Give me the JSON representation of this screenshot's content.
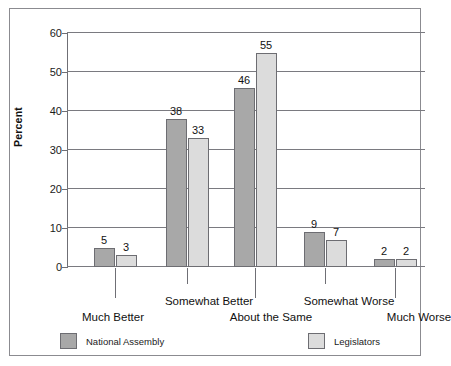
{
  "chart_data": {
    "type": "bar",
    "title": "",
    "xlabel": "",
    "ylabel": "Percent",
    "ylim": [
      0,
      60
    ],
    "yticks": [
      0,
      10,
      20,
      30,
      40,
      50,
      60
    ],
    "ytick_labels": [
      "0",
      "10",
      "20",
      "30",
      "40",
      "50",
      "60"
    ],
    "grid": true,
    "legend_position": "bottom",
    "categories": [
      "Much Better",
      "Somewhat Better",
      "About the Same",
      "Somewhat Worse",
      "Much Worse"
    ],
    "series": [
      {
        "name": "National Assembly",
        "color": "#a8a8a8",
        "values": [
          5,
          38,
          46,
          9,
          2
        ],
        "value_labels": [
          "5",
          "38",
          "46",
          "9",
          "2"
        ]
      },
      {
        "name": "Legislators",
        "color": "#dcdcdc",
        "values": [
          3,
          33,
          55,
          7,
          2
        ],
        "value_labels": [
          "3",
          "33",
          "55",
          "7",
          "2"
        ]
      }
    ]
  },
  "legend": {
    "items": [
      {
        "label": "National Assembly",
        "swatch": "s0"
      },
      {
        "label": "Legislators",
        "swatch": "s1"
      }
    ]
  },
  "colors": {
    "series_1": "#a8a8a8",
    "series_2": "#dcdcdc",
    "axis": "#6f6f75",
    "grid": "#7a7a80",
    "frame": "#8b8b90",
    "text": "#111111"
  }
}
